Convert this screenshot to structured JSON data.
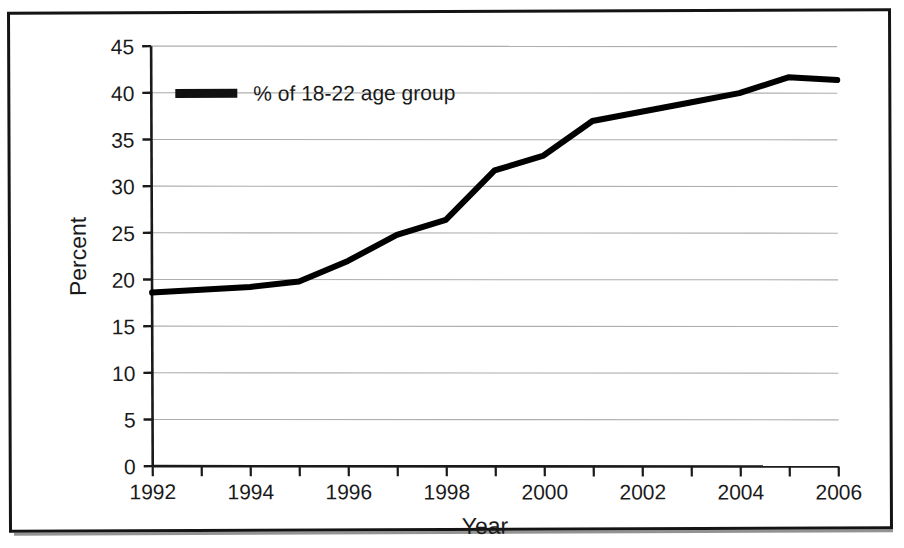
{
  "chart_data": {
    "type": "line",
    "title": "",
    "subtitle": "",
    "xlabel": "Year",
    "ylabel": "Percent",
    "xlim": [
      1992,
      2006
    ],
    "ylim": [
      0,
      45
    ],
    "grid": true,
    "grid_axis": "y",
    "legend_position": "upper-left-inside",
    "x": [
      1992,
      1993,
      1994,
      1995,
      1996,
      1997,
      1998,
      1999,
      2000,
      2001,
      2002,
      2003,
      2004,
      2005,
      2006
    ],
    "series": [
      {
        "name": "% of 18-22 age group",
        "color": "#000000",
        "line_width": 6,
        "values": [
          18.6,
          18.9,
          19.2,
          19.8,
          22.0,
          24.8,
          26.4,
          31.7,
          33.3,
          37.0,
          38.0,
          39.0,
          40.0,
          41.7,
          41.4
        ]
      }
    ],
    "x_tick_labels": [
      "1992",
      "1994",
      "1996",
      "1998",
      "2000",
      "2002",
      "2004",
      "2006"
    ],
    "x_tick_values": [
      1992,
      1994,
      1996,
      1998,
      2000,
      2002,
      2004,
      2006
    ],
    "x_minor_tick_values": [
      1993,
      1995,
      1997,
      1999,
      2001,
      2003,
      2005
    ],
    "y_tick_labels": [
      "0",
      "5",
      "10",
      "15",
      "20",
      "25",
      "30",
      "35",
      "40",
      "45"
    ],
    "y_tick_values": [
      0,
      5,
      10,
      15,
      20,
      25,
      30,
      35,
      40,
      45
    ],
    "annotations": []
  },
  "legend": {
    "entries": [
      {
        "label": "% of 18-22 age group",
        "swatch_color": "#111111"
      }
    ]
  },
  "axes": {
    "y_title": "Percent",
    "x_title": "Year"
  },
  "colors": {
    "line": "#0d0d0d",
    "gridline": "#9a9a9a",
    "axis": "#1a1a1a",
    "frame": "#141414",
    "background": "#ffffff"
  }
}
